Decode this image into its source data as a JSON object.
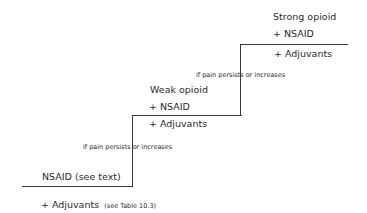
{
  "diagram": {
    "steps": [
      {
        "level": 1,
        "drug": "NSAID (see text)",
        "adjuvant_prefix": "+ Adjuvants",
        "adjuvant_note": "(see Table 10.3)"
      },
      {
        "level": 2,
        "drug": "Weak opioid",
        "nsaid": "+ NSAID",
        "adjuvants": "+  Adjuvants"
      },
      {
        "level": 3,
        "drug": "Strong opioid",
        "nsaid": "+ NSAID",
        "adjuvants": "+ Adjuvants"
      }
    ],
    "transitions": [
      "if pain persists or increases",
      "if pain persists or increases"
    ]
  }
}
